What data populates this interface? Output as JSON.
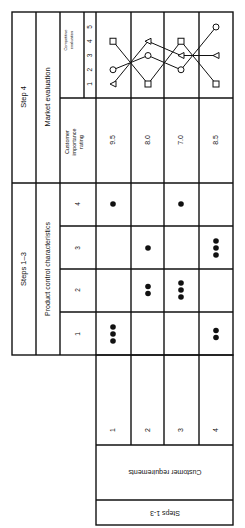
{
  "header": {
    "step4_label": "Step 4",
    "market_evaluation_label": "Market evaluation",
    "steps13_label": "Steps 1–3",
    "product_control_label": "Product control characteristics",
    "customer_importance_label": [
      "Customer",
      "importance",
      "rating"
    ],
    "competitive_evaluation_label": [
      "Competitive",
      "evaluation"
    ],
    "scale": [
      "1",
      "2",
      "3",
      "4",
      "5"
    ],
    "characteristics": [
      "1",
      "2",
      "3",
      "4"
    ]
  },
  "rows": [
    {
      "requirement": "1",
      "relationships": [
        3,
        0,
        0,
        1
      ],
      "importance": "9.5",
      "competitive": {
        "square": 4,
        "circle": 2,
        "triangle": 1
      }
    },
    {
      "requirement": "2",
      "relationships": [
        0,
        2,
        1,
        0
      ],
      "importance": "8.0",
      "competitive": {
        "square": 1,
        "circle": 3,
        "triangle": 4
      }
    },
    {
      "requirement": "3",
      "relationships": [
        0,
        3,
        0,
        1
      ],
      "importance": "7.0",
      "competitive": {
        "square": 4,
        "circle": 2,
        "triangle": 3
      }
    },
    {
      "requirement": "4",
      "relationships": [
        2,
        0,
        3,
        0
      ],
      "importance": "8.5",
      "competitive": {
        "square": 1,
        "circle": 5,
        "triangle": 3
      }
    }
  ],
  "footer": {
    "customer_requirements_label": "Customer requirements",
    "steps13_bottom_label": "Steps 1-3"
  }
}
